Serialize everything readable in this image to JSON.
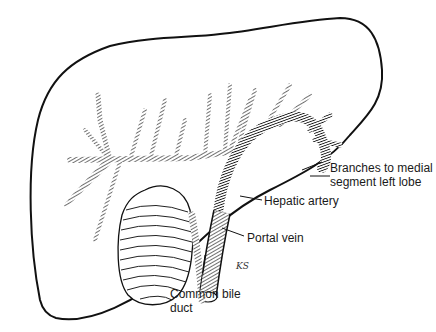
{
  "figure": {
    "labels": {
      "branches_line1": "Branches to medial",
      "branches_line2": "segment left lobe",
      "hepatic_artery": "Hepatic artery",
      "portal_vein": "Portal vein",
      "bile_duct_line1": "Common bile",
      "bile_duct_line2": "duct"
    },
    "signature": "KS"
  },
  "colors": {
    "background": "#ffffff",
    "ink": "#111111",
    "label_text": "#1a1a1a"
  }
}
